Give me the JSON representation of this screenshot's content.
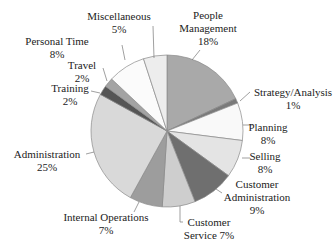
{
  "chart_data": {
    "type": "pie",
    "title": "",
    "start_angle": "12 o'clock",
    "direction": "clockwise",
    "legend": "none (direct labels with leader lines)",
    "slices": [
      {
        "label": "People Management",
        "value": 18,
        "value_label": "18%",
        "color": "#a9a9a9"
      },
      {
        "label": "Strategy/Analysis",
        "value": 1,
        "value_label": "1%",
        "color": "#7a7a7a"
      },
      {
        "label": "Planning",
        "value": 8,
        "value_label": "8%",
        "color": "#f9f9f9"
      },
      {
        "label": "Selling",
        "value": 8,
        "value_label": "8%",
        "color": "#e4e4e4"
      },
      {
        "label": "Customer Administration",
        "value": 9,
        "value_label": "9%",
        "color": "#6f6f6f"
      },
      {
        "label": "Customer Service",
        "value": 7,
        "value_label": "7%",
        "color": "#cecece"
      },
      {
        "label": "Internal Operations",
        "value": 7,
        "value_label": "7%",
        "color": "#9d9d9d"
      },
      {
        "label": "Administration",
        "value": 25,
        "value_label": "25%",
        "color": "#d9d9d9"
      },
      {
        "label": "Training",
        "value": 2,
        "value_label": "2%",
        "color": "#555555"
      },
      {
        "label": "Travel",
        "value": 2,
        "value_label": "2%",
        "color": "#a3a3a3"
      },
      {
        "label": "Personal Time",
        "value": 8,
        "value_label": "8%",
        "color": "#fbfbfb"
      },
      {
        "label": "Miscellaneous",
        "value": 5,
        "value_label": "5%",
        "color": "#ededed"
      }
    ],
    "categories": [
      "People Management",
      "Strategy/Analysis",
      "Planning",
      "Selling",
      "Customer Administration",
      "Customer Service",
      "Internal Operations",
      "Administration",
      "Training",
      "Travel",
      "Personal Time",
      "Miscellaneous"
    ],
    "values": [
      18,
      1,
      8,
      8,
      9,
      7,
      7,
      25,
      2,
      2,
      8,
      5
    ]
  },
  "labels": [
    {
      "lines": [
        "People",
        "Management",
        "18%"
      ],
      "x": 208,
      "y": 19,
      "anchor": "middle",
      "leader": [
        [
          200,
          50
        ],
        [
          192,
          60
        ]
      ]
    },
    {
      "lines": [
        "Strategy/Analysis",
        "1%"
      ],
      "x": 293,
      "y": 96,
      "anchor": "middle",
      "leader": [
        [
          250,
          92
        ],
        [
          240,
          101
        ]
      ]
    },
    {
      "lines": [
        "Planning",
        "8%"
      ],
      "x": 268,
      "y": 131,
      "anchor": "middle",
      "leader": [
        [
          253,
          125
        ],
        [
          243,
          125
        ]
      ]
    },
    {
      "lines": [
        "Selling",
        "8%"
      ],
      "x": 265,
      "y": 160,
      "anchor": "middle",
      "leader": [
        [
          250,
          158
        ],
        [
          242,
          158
        ]
      ]
    },
    {
      "lines": [
        "Customer",
        "Administration",
        "9%"
      ],
      "x": 257,
      "y": 188,
      "anchor": "middle",
      "leader": [
        [
          222,
          193
        ],
        [
          216,
          189
        ]
      ]
    },
    {
      "lines": [
        "Customer",
        "Service 7%"
      ],
      "x": 209,
      "y": 226,
      "anchor": "middle",
      "leader": [
        [
          183,
          222
        ],
        [
          180,
          222
        ],
        [
          180,
          206
        ]
      ]
    },
    {
      "lines": [
        "Internal Operations",
        "7%"
      ],
      "x": 106,
      "y": 221,
      "anchor": "middle",
      "leader": [
        [
          134,
          212
        ],
        [
          139,
          202
        ]
      ]
    },
    {
      "lines": [
        "Administration",
        "25%"
      ],
      "x": 47,
      "y": 158,
      "anchor": "middle",
      "leader": [
        [
          86,
          154
        ],
        [
          94,
          152
        ]
      ]
    },
    {
      "lines": [
        "Training",
        "2%"
      ],
      "x": 70,
      "y": 92,
      "anchor": "middle",
      "leader": [
        [
          91,
          91
        ],
        [
          100,
          93
        ]
      ]
    },
    {
      "lines": [
        "Travel",
        "2%"
      ],
      "x": 82,
      "y": 69,
      "anchor": "middle",
      "leader": [
        [
          103,
          68
        ],
        [
          107,
          81
        ]
      ]
    },
    {
      "lines": [
        "Personal Time",
        "8%"
      ],
      "x": 57,
      "y": 45,
      "anchor": "middle",
      "leader": [
        [
          122,
          45
        ],
        [
          125,
          60
        ]
      ]
    },
    {
      "lines": [
        "Miscellaneous",
        "5%"
      ],
      "x": 119,
      "y": 20,
      "anchor": "middle",
      "leader": [
        [
          153,
          26
        ],
        [
          154,
          58
        ]
      ]
    }
  ],
  "geometry": {
    "cx": 167,
    "cy": 131,
    "r": 76
  }
}
